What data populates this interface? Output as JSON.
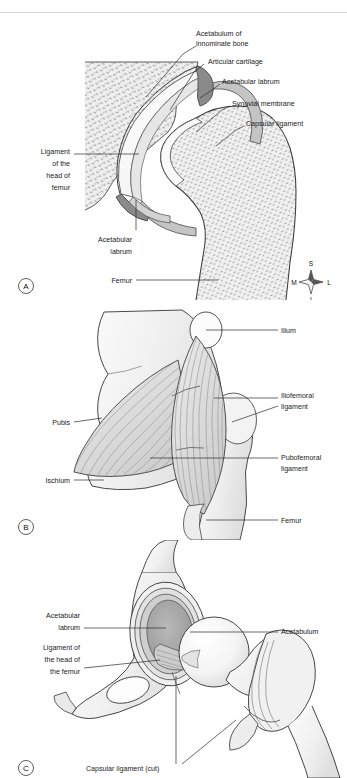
{
  "figure": {
    "background": "#ffffff",
    "ink": "#1b1b1b"
  },
  "panels": [
    {
      "key": "A",
      "name": "coronal-section-hip-joint",
      "labels": [
        {
          "id": "acetabulum-innominate",
          "lines": [
            "Acetabulum of",
            "innominate bone"
          ],
          "anchor": "start",
          "x": 196,
          "y": 22
        },
        {
          "id": "articular-cartilage",
          "lines": [
            "Articular cartilage"
          ],
          "anchor": "start",
          "x": 208,
          "y": 48
        },
        {
          "id": "acetabular-labrum-top",
          "lines": [
            "Acetabular labrum"
          ],
          "anchor": "start",
          "x": 222,
          "y": 68
        },
        {
          "id": "synovial-membrane",
          "lines": [
            "Synovial membrane"
          ],
          "anchor": "start",
          "x": 232,
          "y": 90
        },
        {
          "id": "capsular-ligament",
          "lines": [
            "Capsular ligament"
          ],
          "anchor": "start",
          "x": 246,
          "y": 110
        },
        {
          "id": "ligament-head-femur",
          "lines": [
            "Ligament",
            "of the",
            "head of",
            "femur"
          ],
          "anchor": "end",
          "x": 70,
          "y": 145
        },
        {
          "id": "acetabular-labrum-bottom",
          "lines": [
            "Acetabular",
            "labrum"
          ],
          "anchor": "end",
          "x": 132,
          "y": 228
        },
        {
          "id": "femur",
          "lines": [
            "Femur"
          ],
          "anchor": "end",
          "x": 132,
          "y": 268
        }
      ],
      "compass": {
        "superior": "S",
        "inferior": "I",
        "medial": "M",
        "lateral": "L"
      }
    },
    {
      "key": "B",
      "name": "anterior-hip-ligaments",
      "labels": [
        {
          "id": "ilium",
          "lines": [
            "Ilium"
          ],
          "anchor": "start",
          "x": 280,
          "y": 33
        },
        {
          "id": "iliofemoral-ligament",
          "lines": [
            "Iliofemoral",
            "ligament"
          ],
          "anchor": "start",
          "x": 280,
          "y": 98
        },
        {
          "id": "pubis",
          "lines": [
            "Pubis"
          ],
          "anchor": "end",
          "x": 70,
          "y": 124
        },
        {
          "id": "pubofemoral-ligament",
          "lines": [
            "Pubofemoral",
            "ligament"
          ],
          "anchor": "start",
          "x": 280,
          "y": 160
        },
        {
          "id": "ischium",
          "lines": [
            "Ischium"
          ],
          "anchor": "end",
          "x": 70,
          "y": 182
        },
        {
          "id": "femur",
          "lines": [
            "Femur"
          ],
          "anchor": "start",
          "x": 280,
          "y": 222
        }
      ]
    },
    {
      "key": "C",
      "name": "opened-hip-joint",
      "labels": [
        {
          "id": "acetabular-labrum",
          "lines": [
            "Acetabular",
            "labrum"
          ],
          "anchor": "end",
          "x": 80,
          "y": 80
        },
        {
          "id": "acetabulum",
          "lines": [
            "Acetabulum"
          ],
          "anchor": "start",
          "x": 280,
          "y": 93
        },
        {
          "id": "ligament-head-femur",
          "lines": [
            "Ligament of",
            "the head of",
            "the femur"
          ],
          "anchor": "end",
          "x": 80,
          "y": 116
        },
        {
          "id": "capsular-ligament-cut",
          "lines": [
            "Capsular ligament (cut)"
          ],
          "anchor": "start",
          "x": 86,
          "y": 228
        }
      ]
    }
  ],
  "palette": {
    "bone_fill": "#f2f2f2",
    "bone_stroke": "#3a3a3a",
    "trabecular": "#9a9a9a",
    "cartilage": "#ffffff",
    "labrum": "#8d8d8d",
    "capsule": "#c6c6c6",
    "synovial": "#dcdcdc",
    "ligament_fill": "#e3e3e3",
    "ligament_fiber": "#8e8e8e",
    "shadow": "#cfcfcf"
  }
}
